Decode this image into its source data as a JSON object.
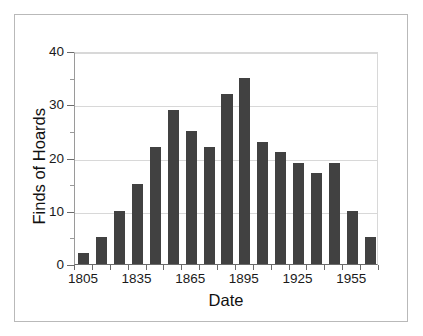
{
  "chart_data": {
    "type": "bar",
    "title": "",
    "subtitle": "",
    "xlabel": "Date",
    "ylabel": "Finds of Hoards",
    "categories": [
      "1805",
      "1815",
      "1825",
      "1835",
      "1845",
      "1855",
      "1865",
      "1875",
      "1885",
      "1895",
      "1905",
      "1915",
      "1925",
      "1935",
      "1945",
      "1955",
      "1965"
    ],
    "values": [
      2,
      5,
      10,
      15,
      22,
      29,
      25,
      22,
      32,
      35,
      23,
      21,
      19,
      17,
      19,
      10,
      5
    ],
    "x_tick_labels": [
      "1805",
      "1835",
      "1865",
      "1895",
      "1925",
      "1955"
    ],
    "x_tick_category_index": [
      0,
      3,
      6,
      9,
      12,
      15
    ],
    "y_tick_labels": [
      "0",
      "10",
      "20",
      "30",
      "40"
    ],
    "y_tick_values": [
      0,
      10,
      20,
      30,
      40
    ],
    "y_minor_tick_values": [
      5,
      15,
      25,
      35
    ],
    "ylim": [
      0,
      40
    ],
    "grid": "horizontal",
    "legend": "none",
    "bar_color": "#414141",
    "gridline_color": "#d8d8d8",
    "axis_color": "#6b6b6b",
    "frame_color": "#b9b9b9",
    "background": "#ffffff"
  },
  "axis": {
    "x_title": "Date",
    "y_title": "Finds of Hoards"
  }
}
